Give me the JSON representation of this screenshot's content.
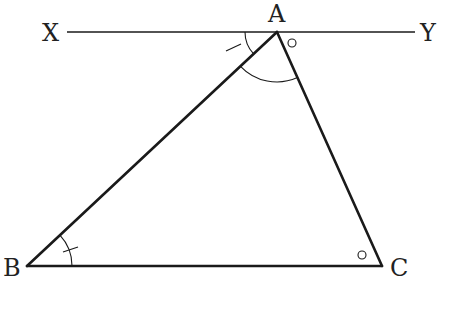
{
  "diagram": {
    "type": "geometry",
    "colors": {
      "background": "#ffffff",
      "stroke": "#1a1a1a",
      "label": "#222222"
    },
    "points": {
      "A": {
        "label": "A",
        "x": 277,
        "y": 32
      },
      "B": {
        "label": "B",
        "x": 27,
        "y": 266
      },
      "C": {
        "label": "C",
        "x": 382,
        "y": 266
      },
      "X": {
        "label": "X",
        "x": 67,
        "y": 32
      },
      "Y": {
        "label": "Y",
        "x": 415,
        "y": 32
      }
    },
    "labels": {
      "A": "A",
      "B": "B",
      "C": "C",
      "X": "X",
      "Y": "Y"
    },
    "segments": [
      {
        "name": "line-XY",
        "from": "X",
        "to": "Y"
      },
      {
        "name": "side-AB",
        "from": "A",
        "to": "B"
      },
      {
        "name": "side-AC",
        "from": "A",
        "to": "C"
      },
      {
        "name": "side-BC",
        "from": "B",
        "to": "C"
      }
    ],
    "angle_marks": [
      {
        "name": "angle-XAB",
        "vertex": "A",
        "mark": "single-tick",
        "note": "equal to angle ABC"
      },
      {
        "name": "angle-BAC",
        "vertex": "A",
        "mark": "arc"
      },
      {
        "name": "angle-CAY",
        "vertex": "A",
        "mark": "small-circle",
        "note": "equal to angle ACB"
      },
      {
        "name": "angle-ABC",
        "vertex": "B",
        "mark": "single-tick"
      },
      {
        "name": "angle-ACB",
        "vertex": "C",
        "mark": "small-circle"
      }
    ]
  }
}
